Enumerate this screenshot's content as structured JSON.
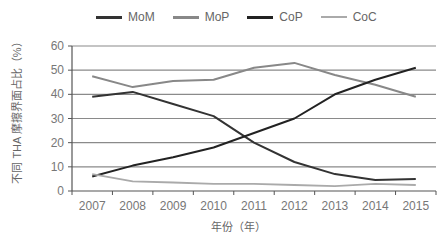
{
  "chart_data": {
    "type": "line",
    "title": "",
    "xlabel": "年份（年）",
    "ylabel": "不同 THA 摩擦界面占比（%）",
    "categories": [
      "2007",
      "2008",
      "2009",
      "2010",
      "2011",
      "2012",
      "2013",
      "2014",
      "2015"
    ],
    "ylim": [
      0,
      60
    ],
    "yticks": [
      0,
      10,
      20,
      30,
      40,
      50,
      60
    ],
    "grid": true,
    "legend_position": "top",
    "series": [
      {
        "name": "MoM",
        "color": "#333333",
        "values": [
          39,
          41,
          36,
          31,
          20,
          12,
          7,
          4.5,
          5
        ]
      },
      {
        "name": "MoP",
        "color": "#888888",
        "values": [
          47.5,
          43,
          45.5,
          46,
          51,
          53,
          48,
          44,
          39
        ]
      },
      {
        "name": "CoP",
        "color": "#222222",
        "values": [
          6,
          10.5,
          14,
          18,
          24,
          30,
          40,
          46,
          51
        ]
      },
      {
        "name": "CoC",
        "color": "#aaaaaa",
        "values": [
          7,
          4,
          3.5,
          3,
          3,
          2.5,
          2,
          3,
          2.5
        ]
      }
    ]
  },
  "legend": [
    {
      "label": "MoM",
      "color": "#333333"
    },
    {
      "label": "MoP",
      "color": "#888888"
    },
    {
      "label": "CoP",
      "color": "#222222"
    },
    {
      "label": "CoC",
      "color": "#aaaaaa"
    }
  ],
  "axis": {
    "xlabel": "年份（年）",
    "ylabel": "不同 THA 摩擦界面占比（%）"
  }
}
